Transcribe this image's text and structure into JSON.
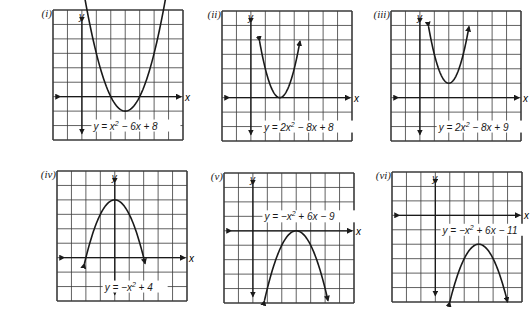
{
  "chart_data": [
    {
      "type": "line",
      "panel_label": "(i)",
      "title": "y = x² − 6x + 8",
      "equation": {
        "prefix": "y = x",
        "sup": "2",
        "suffix": " − 6x + 8"
      },
      "xlabel": "x",
      "ylabel": "y",
      "grid": {
        "cols": 9,
        "rows": 9,
        "y_axis_col": 2,
        "x_axis_row": 6
      },
      "coefficients": {
        "a": 1,
        "b": -6,
        "c": 8
      },
      "vertex": [
        3,
        -1
      ],
      "roots": [
        2,
        4
      ],
      "opens": "up",
      "xlim": [
        -2,
        7
      ],
      "ylim": [
        -3,
        6
      ],
      "plot_range": [
        -0.5,
        6.5
      ],
      "label_pos": {
        "col": 2.8,
        "row": 8
      }
    },
    {
      "type": "line",
      "panel_label": "(ii)",
      "title": "y = 2x² − 8x + 8",
      "equation": {
        "prefix": "y = 2x",
        "sup": "2",
        "suffix": " − 8x + 8"
      },
      "xlabel": "x",
      "ylabel": "y",
      "grid": {
        "cols": 9,
        "rows": 9,
        "y_axis_col": 2,
        "x_axis_row": 6
      },
      "coefficients": {
        "a": 2,
        "b": -8,
        "c": 8
      },
      "vertex": [
        2,
        0
      ],
      "roots": [
        2
      ],
      "opens": "up",
      "xlim": [
        -2,
        7
      ],
      "ylim": [
        -3,
        6
      ],
      "plot_range": [
        0.6,
        3.4
      ],
      "label_pos": {
        "col": 2.9,
        "row": 8
      }
    },
    {
      "type": "line",
      "panel_label": "(iii)",
      "title": "y = 2x² − 8x + 9",
      "equation": {
        "prefix": "y = 2x",
        "sup": "2",
        "suffix": " − 8x + 9"
      },
      "xlabel": "x",
      "ylabel": "y",
      "grid": {
        "cols": 9,
        "rows": 9,
        "y_axis_col": 2,
        "x_axis_row": 6
      },
      "coefficients": {
        "a": 2,
        "b": -8,
        "c": 9
      },
      "vertex": [
        2,
        1
      ],
      "roots": [],
      "opens": "up",
      "xlim": [
        -2,
        7
      ],
      "ylim": [
        -3,
        6
      ],
      "plot_range": [
        0.6,
        3.4
      ],
      "label_pos": {
        "col": 3.3,
        "row": 8
      }
    },
    {
      "type": "line",
      "panel_label": "(iv)",
      "title": "y = −x² + 4",
      "equation": {
        "prefix": "y = −x",
        "sup": "2",
        "suffix": " + 4"
      },
      "xlabel": "x",
      "ylabel": "y",
      "grid": {
        "cols": 9,
        "rows": 9,
        "y_axis_col": 4,
        "x_axis_row": 6
      },
      "coefficients": {
        "a": -1,
        "b": 0,
        "c": 4
      },
      "vertex": [
        0,
        4
      ],
      "roots": [
        -2,
        2
      ],
      "opens": "down",
      "xlim": [
        -4,
        5
      ],
      "ylim": [
        -3,
        6
      ],
      "plot_range": [
        -2.1,
        2.1
      ],
      "label_pos": {
        "col": 3.3,
        "row": 8
      }
    },
    {
      "type": "line",
      "panel_label": "(v)",
      "title": "y = −x² + 6x − 9",
      "equation": {
        "prefix": "y = −x",
        "sup": "2",
        "suffix": " + 6x − 9"
      },
      "xlabel": "x",
      "ylabel": "y",
      "grid": {
        "cols": 9,
        "rows": 9,
        "y_axis_col": 2,
        "x_axis_row": 4
      },
      "coefficients": {
        "a": -1,
        "b": 6,
        "c": -9
      },
      "vertex": [
        3,
        0
      ],
      "roots": [
        3
      ],
      "opens": "down",
      "xlim": [
        -2,
        7
      ],
      "ylim": [
        -5,
        4
      ],
      "plot_range": [
        0.8,
        5.2
      ],
      "label_pos": {
        "col": 2.8,
        "row": 3
      }
    },
    {
      "type": "line",
      "panel_label": "(vi)",
      "title": "y = −x² + 6x − 11",
      "equation": {
        "prefix": "y = −x",
        "sup": "2",
        "suffix": " + 6x − 11"
      },
      "xlabel": "x",
      "ylabel": "y",
      "grid": {
        "cols": 9,
        "rows": 9,
        "y_axis_col": 3,
        "x_axis_row": 3
      },
      "coefficients": {
        "a": -1,
        "b": 6,
        "c": -11
      },
      "vertex": [
        3,
        -2
      ],
      "roots": [],
      "opens": "down",
      "xlim": [
        -3,
        6
      ],
      "ylim": [
        -6,
        3
      ],
      "plot_range": [
        1.0,
        5.0
      ],
      "label_pos": {
        "col": 3.5,
        "row": 4
      }
    }
  ],
  "layout": {
    "panels": [
      {
        "left": 53,
        "top": 10,
        "size": 130
      },
      {
        "left": 222,
        "top": 11,
        "size": 130
      },
      {
        "left": 391,
        "top": 11,
        "size": 130
      },
      {
        "left": 57,
        "top": 171,
        "size": 130
      },
      {
        "left": 224,
        "top": 173,
        "size": 130
      },
      {
        "left": 392,
        "top": 172,
        "size": 130
      }
    ],
    "colors": {
      "grid": "#3a3a3a",
      "curve": "#1a1a1a",
      "background": "#ffffff"
    }
  }
}
